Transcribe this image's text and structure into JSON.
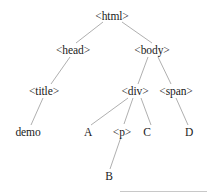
{
  "diagram": {
    "type": "dom-tree",
    "nodes": [
      {
        "id": "html",
        "label": "<html>",
        "x": 112,
        "y": 10
      },
      {
        "id": "head",
        "label": "<head>",
        "x": 73,
        "y": 44
      },
      {
        "id": "body",
        "label": "<body>",
        "x": 152,
        "y": 44
      },
      {
        "id": "title",
        "label": "<title>",
        "x": 44,
        "y": 85
      },
      {
        "id": "div",
        "label": "<div>",
        "x": 135,
        "y": 85
      },
      {
        "id": "span",
        "label": "<span>",
        "x": 176,
        "y": 85
      },
      {
        "id": "demo",
        "label": "demo",
        "x": 28,
        "y": 126
      },
      {
        "id": "A",
        "label": "A",
        "x": 88,
        "y": 126
      },
      {
        "id": "p",
        "label": "<p>",
        "x": 122,
        "y": 126
      },
      {
        "id": "C",
        "label": "C",
        "x": 147,
        "y": 126
      },
      {
        "id": "D",
        "label": "D",
        "x": 189,
        "y": 126
      },
      {
        "id": "B",
        "label": "B",
        "x": 109,
        "y": 170
      }
    ],
    "edges": [
      {
        "from": "html",
        "to": "head",
        "x1": 103,
        "y1": 22,
        "x2": 76,
        "y2": 43
      },
      {
        "from": "html",
        "to": "body",
        "x1": 122,
        "y1": 22,
        "x2": 152,
        "y2": 43
      },
      {
        "from": "head",
        "to": "title",
        "x1": 70,
        "y1": 57,
        "x2": 51,
        "y2": 84
      },
      {
        "from": "body",
        "to": "div",
        "x1": 148,
        "y1": 57,
        "x2": 138,
        "y2": 84
      },
      {
        "from": "body",
        "to": "span",
        "x1": 158,
        "y1": 57,
        "x2": 171,
        "y2": 84
      },
      {
        "from": "title",
        "to": "demo",
        "x1": 43,
        "y1": 98,
        "x2": 31,
        "y2": 125
      },
      {
        "from": "div",
        "to": "A",
        "x1": 128,
        "y1": 98,
        "x2": 91,
        "y2": 125
      },
      {
        "from": "div",
        "to": "p",
        "x1": 133,
        "y1": 98,
        "x2": 124,
        "y2": 124
      },
      {
        "from": "div",
        "to": "C",
        "x1": 141,
        "y1": 98,
        "x2": 151,
        "y2": 125
      },
      {
        "from": "span",
        "to": "D",
        "x1": 176,
        "y1": 98,
        "x2": 188,
        "y2": 125
      },
      {
        "from": "p",
        "to": "B",
        "x1": 121,
        "y1": 137,
        "x2": 110,
        "y2": 169
      }
    ]
  },
  "colors": {
    "background": "#ffffff",
    "text": "#1a1a1a",
    "edge": "#9a9a9a",
    "rule": "#c8c8c8"
  }
}
